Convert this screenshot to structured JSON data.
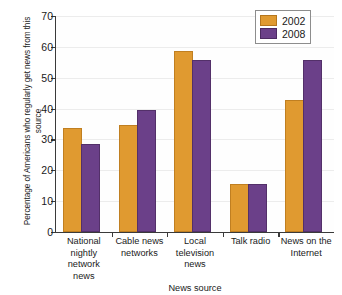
{
  "chart_data": {
    "type": "bar",
    "title": "",
    "xlabel": "News source",
    "ylabel": "Percentage of Americans who regularly get news from this source",
    "categories": [
      "National nightly network news",
      "Cable news networks",
      "Local television news",
      "Talk radio",
      "News on the Internet"
    ],
    "series": [
      {
        "name": "2002",
        "color": "#e09a30",
        "values": [
          33,
          34,
          58,
          15,
          42
        ]
      },
      {
        "name": "2008",
        "color": "#6b4089",
        "values": [
          28,
          39,
          55,
          15,
          55
        ]
      }
    ],
    "ylim": [
      0,
      70
    ],
    "yticks": [
      0,
      10,
      20,
      30,
      40,
      50,
      60,
      70
    ],
    "grid": true,
    "legend_position": "top-right"
  },
  "legend": {
    "items": [
      {
        "label": "2002"
      },
      {
        "label": "2008"
      }
    ]
  }
}
